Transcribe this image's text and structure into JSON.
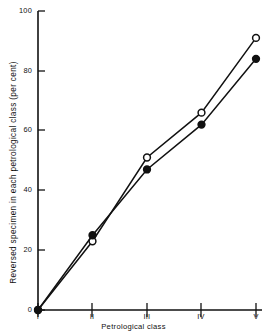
{
  "chart_data": {
    "type": "line",
    "title": "",
    "xlabel": "Petrological class",
    "ylabel": "Reversed specimen in each petrological class (per cent)",
    "categories": [
      "I",
      "II",
      "III",
      "IV",
      "V"
    ],
    "xtick_labels": [
      "I",
      "II",
      "III",
      "IV",
      "V"
    ],
    "ytick_labels": [
      "0",
      "20",
      "40",
      "60",
      "80",
      "100"
    ],
    "yticks": [
      0,
      20,
      40,
      60,
      80,
      100
    ],
    "ylim": [
      0,
      100
    ],
    "xlim": [
      0,
      4
    ],
    "grid": false,
    "legend": "none",
    "series": [
      {
        "name": "open-circle-series",
        "marker": "open-circle",
        "color": "#111111",
        "values": [
          0,
          23,
          51,
          66,
          91
        ]
      },
      {
        "name": "filled-circle-series",
        "marker": "filled-circle",
        "color": "#111111",
        "values": [
          0,
          25,
          47,
          62,
          84
        ]
      }
    ]
  },
  "axes": {
    "y_label_text": "Reversed specimen in each petrological class (per cent)",
    "x_label_text": "Petrological class",
    "y_tick_0": "0",
    "y_tick_1": "20",
    "y_tick_2": "40",
    "y_tick_3": "60",
    "y_tick_4": "80",
    "y_tick_5": "100",
    "x_tick_0": "I",
    "x_tick_1": "II",
    "x_tick_2": "III",
    "x_tick_3": "IV",
    "x_tick_4": "V"
  },
  "style": {
    "axis_color": "#111111",
    "line_color": "#111111",
    "background": "#ffffff"
  }
}
